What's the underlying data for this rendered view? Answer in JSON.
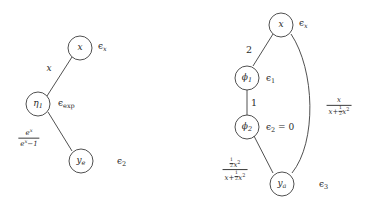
{
  "figure": {
    "type": "computation-graph-pair",
    "background_color": "#ffffff",
    "stroke_color": "#3c3c3c",
    "text_color": "#2a2a2a"
  },
  "left_graph": {
    "name": "exponential-node-graph",
    "nodes": [
      {
        "id": "x",
        "label": "x",
        "subscript": "",
        "eps_label": "ϵ",
        "eps_sub": "x"
      },
      {
        "id": "eta1",
        "label": "η",
        "subscript": "1",
        "eps_label": "ϵ",
        "eps_sub": "exp"
      },
      {
        "id": "ye",
        "label": "y",
        "subscript": "e",
        "eps_label": "ϵ",
        "eps_sub": "2"
      }
    ],
    "edges": [
      {
        "from": "eta1",
        "to": "x",
        "label": "x",
        "label_type": "plain"
      },
      {
        "from": "eta1",
        "to": "ye",
        "label_type": "fraction",
        "numerator": "eˣ",
        "denominator": "eˣ − 1"
      }
    ]
  },
  "right_graph": {
    "name": "phi-node-graph",
    "nodes": [
      {
        "id": "x",
        "label": "x",
        "subscript": "",
        "eps_label": "ϵ",
        "eps_sub": "x"
      },
      {
        "id": "phi1",
        "label": "ϕ",
        "subscript": "1",
        "eps_label": "ϵ",
        "eps_sub": "1"
      },
      {
        "id": "phi2",
        "label": "ϕ",
        "subscript": "2",
        "eps_label": "ϵ",
        "eps_sub": "2",
        "eps_value": " = 0"
      },
      {
        "id": "ya",
        "label": "y",
        "subscript": "a",
        "eps_label": "ϵ",
        "eps_sub": "3"
      }
    ],
    "edges": [
      {
        "from": "phi1",
        "to": "x",
        "label": "2",
        "label_type": "plain"
      },
      {
        "from": "phi1",
        "to": "phi2",
        "label": "1",
        "label_type": "plain"
      },
      {
        "from": "phi2",
        "to": "ya",
        "label_type": "fraction",
        "numerator": "½x²",
        "denominator": "x + ½x²"
      },
      {
        "from": "x",
        "to": "ya",
        "label_type": "fraction",
        "curved": true,
        "numerator": "x",
        "denominator": "x + ½x²"
      }
    ]
  }
}
